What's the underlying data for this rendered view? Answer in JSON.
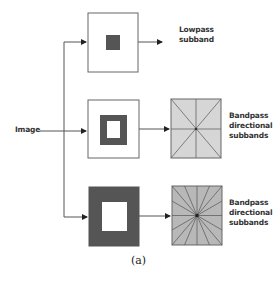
{
  "diagram": {
    "input_label": "Image",
    "branches": [
      {
        "name": "lowpass",
        "output_lines": [
          "Lowpass",
          "subband"
        ]
      },
      {
        "name": "bandpass-1",
        "output_lines": [
          "Bandpass",
          "directional",
          "subbands"
        ],
        "directions": 8
      },
      {
        "name": "bandpass-2",
        "output_lines": [
          "Bandpass",
          "directional",
          "subbands"
        ],
        "directions": 16
      }
    ],
    "caption": "(a)",
    "colors": {
      "dark": "#555555",
      "grid_light": "#d4d4d4",
      "grid_dark": "#b5b5b5",
      "line": "#444444"
    }
  }
}
